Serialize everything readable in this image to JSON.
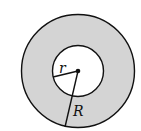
{
  "diagram": {
    "type": "annulus",
    "labels": {
      "inner_radius": "r",
      "outer_radius": "R"
    },
    "colors": {
      "ring_fill": "#d4d4d4",
      "inner_fill": "#ffffff",
      "stroke": "#111111"
    }
  }
}
